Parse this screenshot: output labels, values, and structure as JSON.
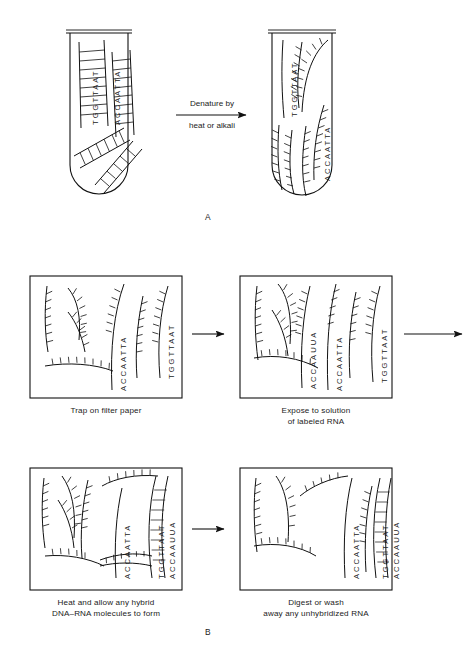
{
  "figure": {
    "panels": [
      {
        "id": "A",
        "label": "A"
      },
      {
        "id": "B",
        "label": "B"
      }
    ]
  },
  "panel_a": {
    "label": "A",
    "arrow": {
      "line1": "Denature by",
      "line2": "heat or alkali"
    },
    "tube_left": {
      "name": "native-double-stranded-dna-tube",
      "sequences": [
        {
          "text": "TGGTTAAT",
          "role": "dna-top-strand"
        },
        {
          "text": "ACCAATTA",
          "role": "dna-bottom-strand"
        }
      ]
    },
    "tube_right": {
      "name": "denatured-single-stranded-dna-tube",
      "sequences": [
        {
          "text": "TGGTTAAT",
          "role": "dna-single-strand"
        },
        {
          "text": "ACCAATTA",
          "role": "dna-single-strand"
        }
      ]
    }
  },
  "panel_b": {
    "label": "B",
    "steps": [
      {
        "id": "step-1",
        "caption": "Trap on filter paper",
        "sequences": [
          {
            "text": "ACCAATTA",
            "role": "dna-single-strand"
          },
          {
            "text": "TGGTTAAT",
            "role": "dna-single-strand"
          }
        ]
      },
      {
        "id": "step-2",
        "caption": "Expose to solution\nof labeled RNA",
        "sequences": [
          {
            "text": "ACCAAUUA",
            "role": "labeled-rna-strand"
          },
          {
            "text": "ACCAATTA",
            "role": "dna-single-strand"
          },
          {
            "text": "TGGTTAAT",
            "role": "dna-single-strand"
          }
        ]
      },
      {
        "id": "step-3",
        "caption": "Heat and allow any hybrid\nDNA–RNA molecules to form",
        "sequences": [
          {
            "text": "ACCAATTA",
            "role": "dna-single-strand"
          },
          {
            "text": "TGGTTAAT",
            "role": "dna-strand-of-hybrid"
          },
          {
            "text": "ACCAAUUA",
            "role": "rna-strand-of-hybrid"
          }
        ]
      },
      {
        "id": "step-4",
        "caption": "Digest or wash\naway any unhybridized RNA",
        "sequences": [
          {
            "text": "ACCAATTA",
            "role": "dna-single-strand"
          },
          {
            "text": "TGGTTAAT",
            "role": "dna-strand-of-hybrid"
          },
          {
            "text": "ACCAAUUA",
            "role": "rna-strand-of-hybrid"
          }
        ]
      }
    ]
  },
  "colors": {
    "ink": "#1a1a1a",
    "background": "#ffffff",
    "text": "#222222"
  }
}
